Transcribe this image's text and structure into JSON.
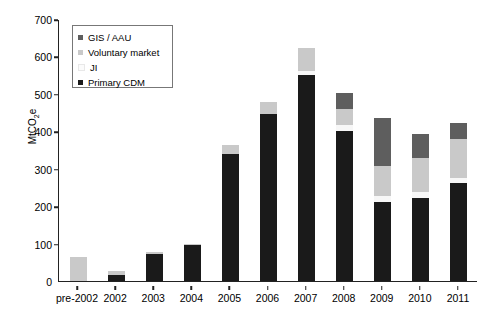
{
  "chart_data": {
    "type": "bar",
    "title": "",
    "subtitle": "",
    "xlabel": "",
    "ylabel": "MtCO2e",
    "ylabel_display": "MtCO",
    "ylabel_sub": "2",
    "ylabel_suffix": "e",
    "stacked": true,
    "grid": false,
    "legend_position": "top-left",
    "ylim": [
      0,
      700
    ],
    "ytick_labels": [
      "0",
      "100",
      "200",
      "300",
      "400",
      "500",
      "600",
      "700"
    ],
    "ytick_values": [
      0,
      100,
      200,
      300,
      400,
      500,
      600,
      700
    ],
    "categories": [
      "pre-2002",
      "2002",
      "2003",
      "2004",
      "2005",
      "2006",
      "2007",
      "2008",
      "2009",
      "2010",
      "2011"
    ],
    "series": [
      {
        "name": "Primary CDM",
        "color": "#1a1a1a",
        "values": [
          0,
          16,
          71,
          96,
          340,
          447,
          550,
          402,
          210,
          221,
          261
        ]
      },
      {
        "name": "JI",
        "color": "#f7f7f7",
        "values": [
          0,
          0,
          0,
          0,
          0,
          0,
          12,
          14,
          16,
          17,
          14
        ]
      },
      {
        "name": "Voluntary market",
        "color": "#c9c9c9",
        "values": [
          65,
          12,
          7,
          3,
          23,
          32,
          60,
          43,
          80,
          92,
          104
        ]
      },
      {
        "name": "GIS / AAU",
        "color": "#5e5e5e",
        "values": [
          0,
          0,
          0,
          0,
          0,
          0,
          0,
          44,
          130,
          64,
          42
        ]
      }
    ],
    "totals": [
      65,
      28,
      78,
      99,
      363,
      479,
      622,
      503,
      436,
      394,
      421
    ]
  },
  "legend": {
    "items": [
      {
        "label": "GIS / AAU",
        "color": "#5e5e5e"
      },
      {
        "label": "Voluntary market",
        "color": "#c9c9c9"
      },
      {
        "label": "JI",
        "color": "#fbfbfb"
      },
      {
        "label": "Primary CDM",
        "color": "#1a1a1a"
      }
    ]
  },
  "axis_color": "#222222"
}
